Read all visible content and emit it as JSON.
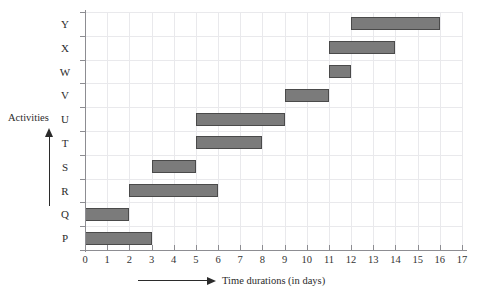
{
  "chart_data": {
    "type": "bar",
    "orientation": "horizontal",
    "subtype": "gantt",
    "title": "",
    "xlabel": "Time durations  (in days)",
    "ylabel": "Activities",
    "xlim": [
      0,
      17
    ],
    "grid": true,
    "legend": null,
    "xticks": [
      "0",
      "1",
      "2",
      "3",
      "4",
      "5",
      "6",
      "7",
      "8",
      "9",
      "10",
      "11",
      "12",
      "13",
      "14",
      "15",
      "16",
      "17"
    ],
    "xtick_values": [
      0,
      1,
      2,
      3,
      4,
      5,
      6,
      7,
      8,
      9,
      10,
      11,
      12,
      13,
      14,
      15,
      16,
      17
    ],
    "categories": [
      "P",
      "Q",
      "R",
      "S",
      "T",
      "U",
      "V",
      "W",
      "X",
      "Y"
    ],
    "bars": [
      {
        "activity": "P",
        "start": 0,
        "end": 3,
        "duration": 3
      },
      {
        "activity": "Q",
        "start": 0,
        "end": 2,
        "duration": 2
      },
      {
        "activity": "R",
        "start": 2,
        "end": 6,
        "duration": 4
      },
      {
        "activity": "S",
        "start": 3,
        "end": 5,
        "duration": 2
      },
      {
        "activity": "T",
        "start": 5,
        "end": 8,
        "duration": 3
      },
      {
        "activity": "U",
        "start": 5,
        "end": 9,
        "duration": 4
      },
      {
        "activity": "V",
        "start": 9,
        "end": 11,
        "duration": 2
      },
      {
        "activity": "W",
        "start": 11,
        "end": 12,
        "duration": 1
      },
      {
        "activity": "X",
        "start": 11,
        "end": 14,
        "duration": 3
      },
      {
        "activity": "Y",
        "start": 12,
        "end": 16,
        "duration": 4
      }
    ],
    "colors": {
      "bar_fill": "#7b7b7b",
      "bar_stroke": "#4a4a4a",
      "gridline": "#e9e9ec",
      "axis": "#8d8d92",
      "text": "#2b2b2b"
    }
  }
}
